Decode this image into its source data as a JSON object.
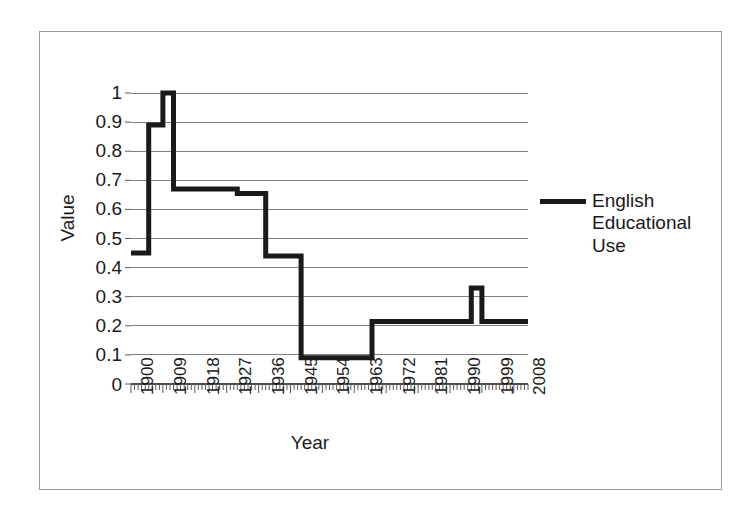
{
  "chart_data": {
    "type": "line",
    "title": "",
    "subtitle": "",
    "xlabel": "Year",
    "ylabel": "Value",
    "xlim": [
      1900,
      2012
    ],
    "ylim": [
      0,
      1
    ],
    "grid": "horizontal",
    "legend_position": "right",
    "line_style": "step",
    "line_color": "#1a1a1a",
    "y_ticks": [
      "1",
      "0.9",
      "0.8",
      "0.7",
      "0.6",
      "0.5",
      "0.4",
      "0.3",
      "0.2",
      "0.1",
      "0"
    ],
    "y_tick_values": [
      1,
      0.9,
      0.8,
      0.7,
      0.6,
      0.5,
      0.4,
      0.3,
      0.2,
      0.1,
      0
    ],
    "x_ticks": [
      "1900",
      "1909",
      "1918",
      "1927",
      "1936",
      "1945",
      "1954",
      "1963",
      "1972",
      "1981",
      "1990",
      "1999",
      "2008"
    ],
    "x_tick_values": [
      1900,
      1909,
      1918,
      1927,
      1936,
      1945,
      1954,
      1963,
      1972,
      1981,
      1990,
      1999,
      2008
    ],
    "minor_ticks": "every year",
    "series": [
      {
        "name": "English Educational Use",
        "legend_label_lines": [
          "English",
          "Educational",
          "Use"
        ],
        "color": "#1a1a1a",
        "x": [
          1900,
          1905,
          1909,
          1912,
          1920,
          1930,
          1938,
          1948,
          1968,
          1996,
          1999,
          2012
        ],
        "values": [
          0.45,
          0.89,
          1.0,
          1.0,
          0.67,
          0.655,
          0.44,
          0.09,
          0.215,
          0.33,
          0.215,
          0.215
        ],
        "steps": [
          {
            "from_year": 1900,
            "to_year": 1905,
            "value": 0.45
          },
          {
            "from_year": 1905,
            "to_year": 1909,
            "value": 0.89
          },
          {
            "from_year": 1909,
            "to_year": 1912,
            "value": 1.0
          },
          {
            "from_year": 1912,
            "to_year": 1920,
            "value": 0.67
          },
          {
            "from_year": 1920,
            "to_year": 1930,
            "value": 0.67
          },
          {
            "from_year": 1930,
            "to_year": 1938,
            "value": 0.655
          },
          {
            "from_year": 1938,
            "to_year": 1948,
            "value": 0.44
          },
          {
            "from_year": 1948,
            "to_year": 1968,
            "value": 0.09
          },
          {
            "from_year": 1968,
            "to_year": 1996,
            "value": 0.215
          },
          {
            "from_year": 1996,
            "to_year": 1999,
            "value": 0.33
          },
          {
            "from_year": 1999,
            "to_year": 2012,
            "value": 0.215
          }
        ]
      }
    ]
  },
  "legend": {
    "entries": [
      {
        "label_line_1": "English",
        "label_line_2": "Educational",
        "label_line_3": "Use"
      }
    ]
  },
  "axes": {
    "y_title": "Value",
    "x_title": "Year"
  }
}
